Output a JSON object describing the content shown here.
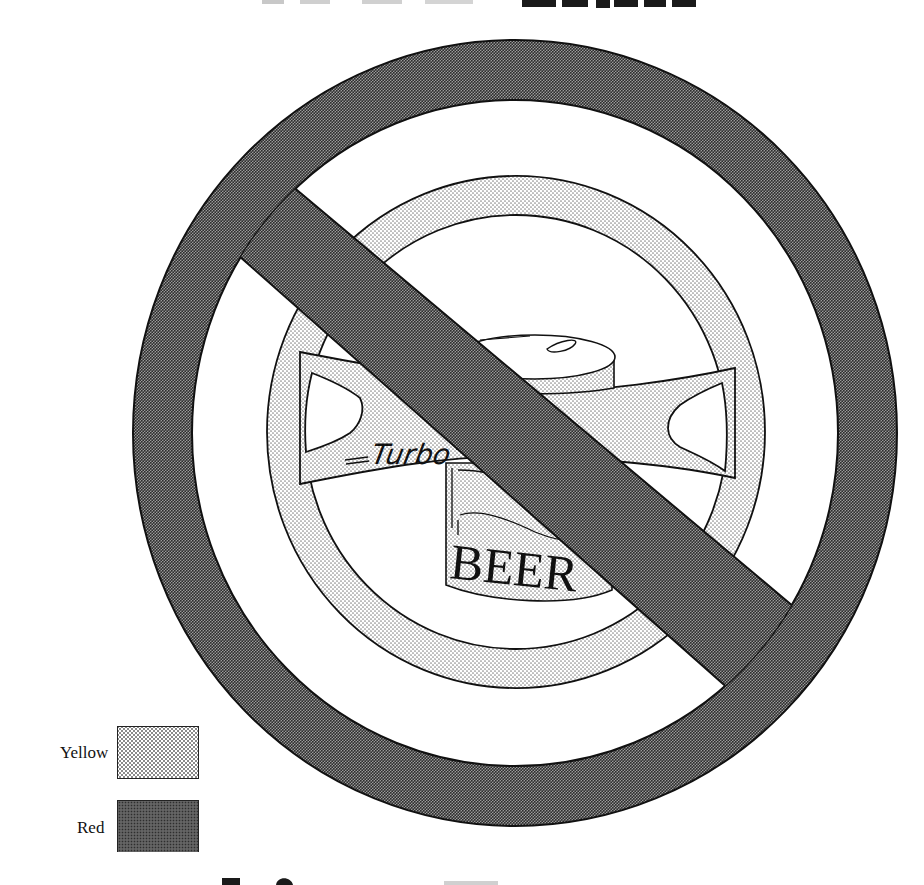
{
  "diagram": {
    "type": "prohibition-sign",
    "can_label": "BEER",
    "wheel_label": "Turbo",
    "wheel_label_decoration": "=Turbo="
  },
  "legend": {
    "items": [
      {
        "label": "Yellow",
        "pattern": "light-stipple",
        "meaning": "steering wheel and can fill"
      },
      {
        "label": "Red",
        "pattern": "dense-checker",
        "meaning": "prohibition ring and slash fill"
      }
    ]
  },
  "colors": {
    "ink": "#111111",
    "paper": "#ffffff",
    "yellow_halftone_dot": "#8a8a8a",
    "red_halftone_dot": "#3a3a3a"
  },
  "cropped_text": {
    "top": "partially visible heading (cut off at top edge)",
    "bottom": "partially visible heading (cut off at bottom edge)"
  }
}
